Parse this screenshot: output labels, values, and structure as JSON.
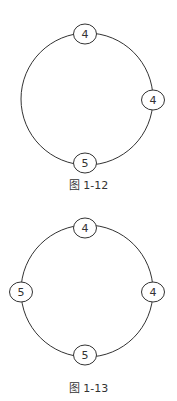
{
  "figures": [
    {
      "caption": "图 1-12",
      "ring": {
        "cx": 87,
        "cy": 99,
        "r": 66
      },
      "nodes": [
        {
          "label": "4",
          "cx": 85,
          "cy": 34
        },
        {
          "label": "4",
          "cx": 153,
          "cy": 100
        },
        {
          "label": "5",
          "cx": 85,
          "cy": 163
        }
      ]
    },
    {
      "caption": "图 1-13",
      "ring": {
        "cx": 87,
        "cy": 291,
        "r": 66
      },
      "nodes": [
        {
          "label": "4",
          "cx": 85,
          "cy": 228
        },
        {
          "label": "5",
          "cx": 21,
          "cy": 292
        },
        {
          "label": "4",
          "cx": 153,
          "cy": 292
        },
        {
          "label": "5",
          "cx": 85,
          "cy": 355
        }
      ]
    }
  ]
}
